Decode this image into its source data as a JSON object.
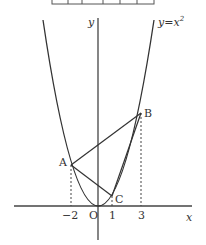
{
  "figure": {
    "curve_label": "y=x²",
    "curve_label_base": "y=x",
    "curve_label_exp": "2",
    "axis_x_label": "x",
    "axis_y_label": "y",
    "origin_label": "O",
    "points": [
      {
        "name": "A",
        "x": -2,
        "y": 4
      },
      {
        "name": "B",
        "x": 3,
        "y": 9
      },
      {
        "name": "C",
        "x": 1,
        "y": 1
      }
    ],
    "x_ticks": [
      {
        "label": "−2",
        "value": -2
      },
      {
        "label": "1",
        "value": 1
      },
      {
        "label": "3",
        "value": 3
      }
    ],
    "segments": [
      "AB",
      "AC",
      "BC"
    ],
    "function": "y = x^2",
    "colors": {
      "line": "#333333",
      "background": "#ffffff"
    }
  }
}
